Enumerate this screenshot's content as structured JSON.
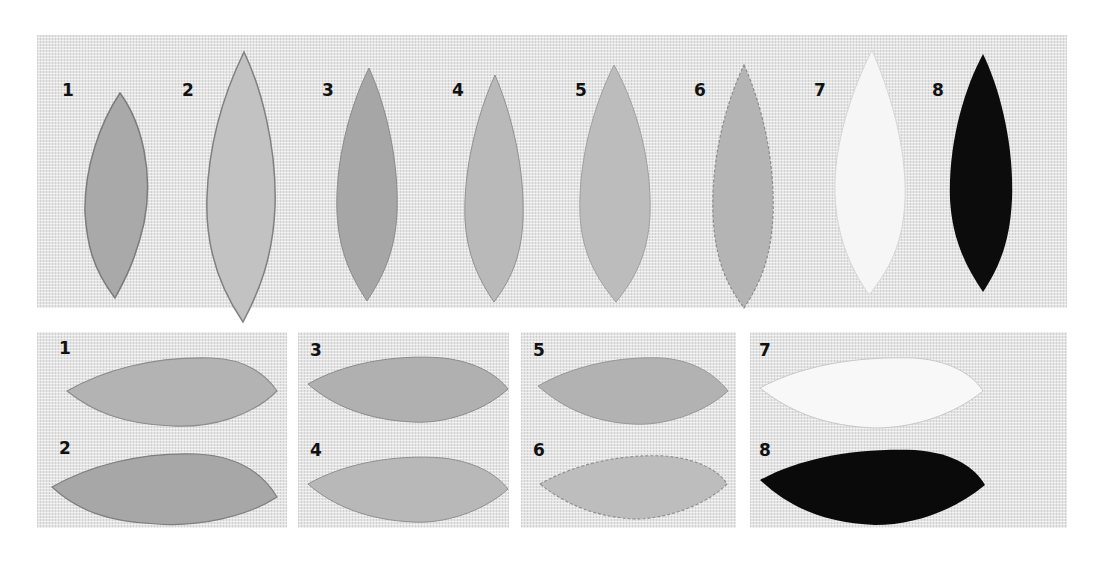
{
  "top_row": {
    "samples": [
      {
        "label": "1",
        "fill": "#a9a9a9",
        "texture": "diagonal-stitch"
      },
      {
        "label": "2",
        "fill": "#c2c2c2",
        "texture": "horizontal-stitch"
      },
      {
        "label": "3",
        "fill": "#a6a6a6",
        "texture": "long-short"
      },
      {
        "label": "4",
        "fill": "#b9b9b9",
        "texture": "long-short"
      },
      {
        "label": "5",
        "fill": "#bcbcbc",
        "texture": "long-short"
      },
      {
        "label": "6",
        "fill": "#b4b4b4",
        "texture": "french-knots"
      },
      {
        "label": "7",
        "fill": "#f6f6f6",
        "texture": "long-short-white"
      },
      {
        "label": "8",
        "fill": "#0c0c0c",
        "texture": "long-short-black"
      }
    ]
  },
  "bottom_row": {
    "samples": [
      {
        "label": "1",
        "fill": "#b3b3b3"
      },
      {
        "label": "2",
        "fill": "#a7a7a7"
      },
      {
        "label": "3",
        "fill": "#b0b0b0"
      },
      {
        "label": "4",
        "fill": "#b8b8b8"
      },
      {
        "label": "5",
        "fill": "#b2b2b2"
      },
      {
        "label": "6",
        "fill": "#bdbdbd"
      },
      {
        "label": "7",
        "fill": "#f8f8f8"
      },
      {
        "label": "8",
        "fill": "#0a0a0a"
      }
    ]
  },
  "colors": {
    "fabric": "#e4e4e4",
    "background": "#ffffff",
    "label": "#111111"
  }
}
